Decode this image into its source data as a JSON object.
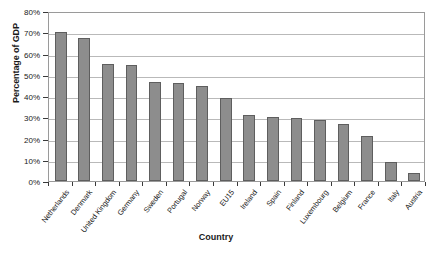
{
  "chart_data": {
    "type": "bar",
    "title": "",
    "xlabel": "Country",
    "ylabel": "Percentage of GDP",
    "categories": [
      "Netherlands",
      "Denmark",
      "United Kingdom",
      "Germany",
      "Sweden",
      "Portugal",
      "Norway",
      "EU15",
      "Ireland",
      "Spain",
      "Finland",
      "Luxembourg",
      "Belgium",
      "France",
      "Italy",
      "Austria"
    ],
    "values": [
      70,
      67.5,
      55,
      54.5,
      46.5,
      46,
      44.5,
      39,
      31,
      30,
      29.5,
      28.5,
      27,
      21,
      9,
      4
    ],
    "ylim": [
      0,
      80
    ],
    "yticks": [
      0,
      10,
      20,
      30,
      40,
      50,
      60,
      70,
      80
    ],
    "ytick_labels": [
      "0%",
      "10%",
      "20%",
      "30%",
      "40%",
      "50%",
      "60%",
      "70%",
      "80%"
    ],
    "grid": true,
    "legend": "none",
    "bar_color": "#8d8d8d",
    "bar_edge_color": "#5e5e5e",
    "grid_color": "#b9b9b9",
    "axis_color": "#9a9a9a"
  }
}
